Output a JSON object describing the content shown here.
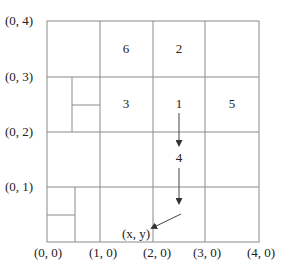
{
  "diagram": {
    "type": "quadtree-grid",
    "colors": {
      "line": "#8a8a8a",
      "text": "#222222",
      "arrow": "#444444"
    },
    "axis_labels": {
      "y": [
        "(0, 4)",
        "(0, 3)",
        "(0, 2)",
        "(0, 1)"
      ],
      "x": [
        "(0, 0)",
        "(1, 0)",
        "(2, 0)",
        "(3, 0)",
        "(4, 0)"
      ]
    },
    "cell_labels": {
      "c6": "6",
      "c2": "2",
      "c3": "3",
      "c1": "1",
      "c5": "5",
      "c4": "4"
    },
    "point_label": "(x, y)"
  }
}
